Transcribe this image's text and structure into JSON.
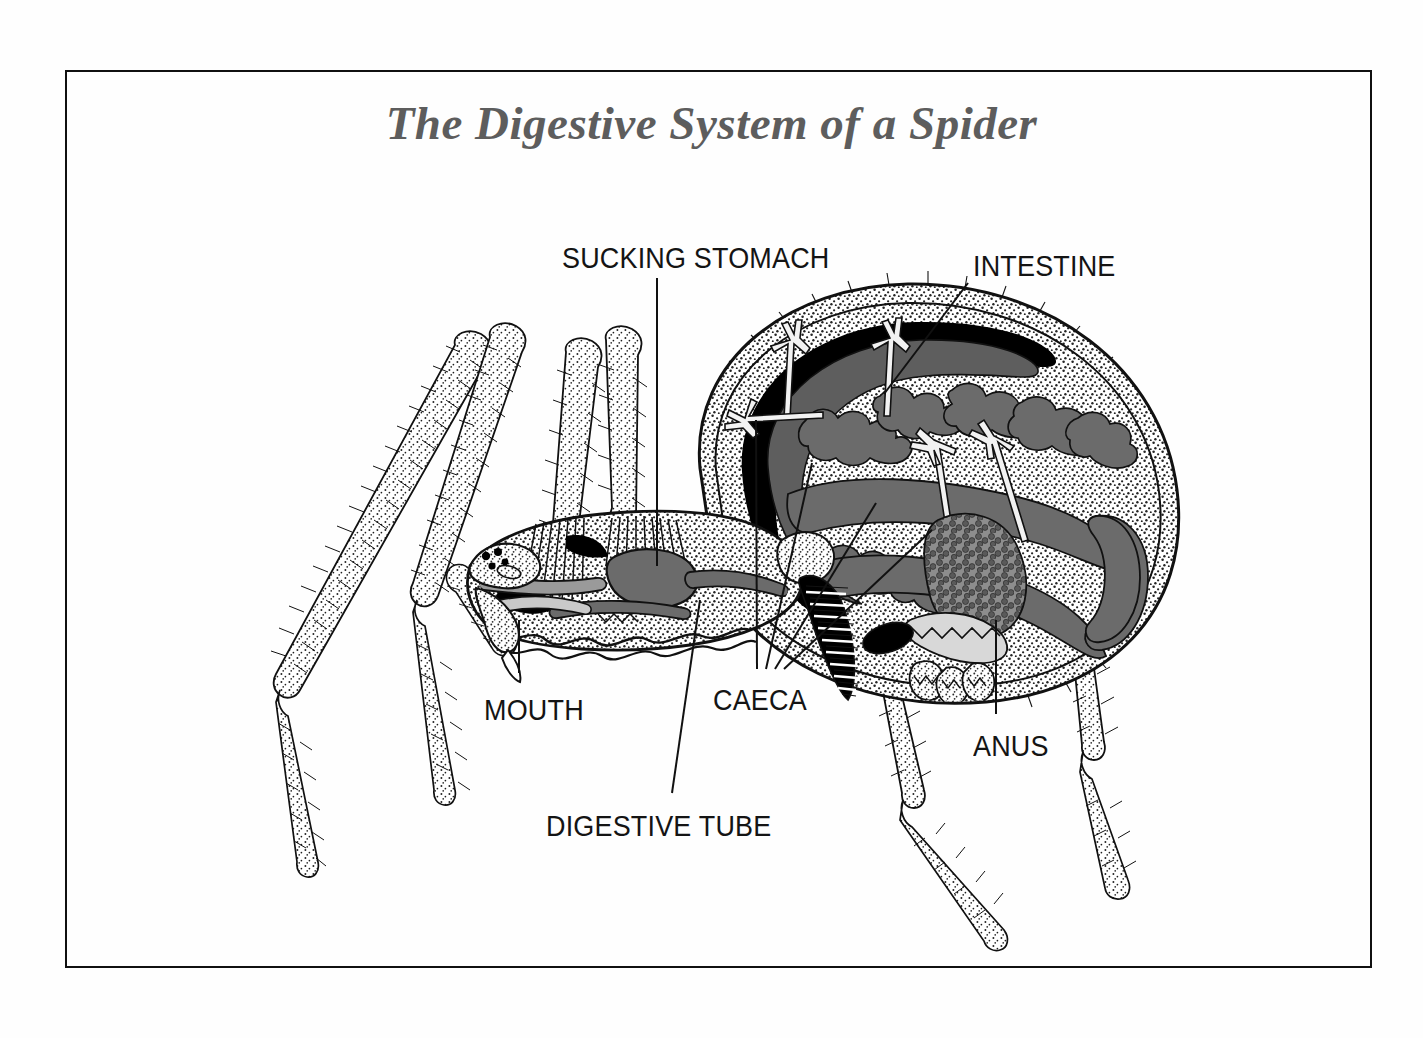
{
  "figure": {
    "title": "The Digestive System of a Spider",
    "title_color": "#5d5d5d",
    "frame_color": "#101010",
    "background_color": "#fefefe",
    "style": "stippled-line-drawing"
  },
  "labels": [
    {
      "id": "sucking-stomach",
      "text": "SUCKING STOMACH",
      "x": 562,
      "y": 242
    },
    {
      "id": "intestine",
      "text": "INTESTINE",
      "x": 973,
      "y": 250
    },
    {
      "id": "mouth",
      "text": "MOUTH",
      "x": 484,
      "y": 694
    },
    {
      "id": "caeca",
      "text": "CAECA",
      "x": 713,
      "y": 684
    },
    {
      "id": "anus",
      "text": "ANUS",
      "x": 973,
      "y": 730
    },
    {
      "id": "digestive-tube",
      "text": "DIGESTIVE TUBE",
      "x": 546,
      "y": 810
    }
  ],
  "leader_lines": [
    {
      "id": "sucking-stomach-leader",
      "points": "657,278 657,566"
    },
    {
      "id": "intestine-leader",
      "points": "968,283 884,394"
    },
    {
      "id": "mouth-leader",
      "points": "519,673 519,620"
    },
    {
      "id": "caeca-leader-1",
      "points": "757,669 756,420"
    },
    {
      "id": "caeca-leader-2",
      "points": "766,669 812,463"
    },
    {
      "id": "caeca-leader-3",
      "points": "775,669 876,503"
    },
    {
      "id": "caeca-leader-4",
      "points": "784,669 932,530"
    },
    {
      "id": "anus-leader",
      "points": "996,714 996,620"
    },
    {
      "id": "digestive-tube-leader",
      "points": "672,793 700,600"
    }
  ],
  "colors": {
    "ink": "#111111",
    "organ_gray": "#6b6b6b",
    "organ_dark": "#4a4a4a",
    "organ_light": "#c9c9c9",
    "stipple": "#2a2a2a",
    "black": "#000000",
    "paper": "#fefefe"
  },
  "anatomy_parts": [
    "cephalothorax",
    "abdomen",
    "chelicera",
    "pedipalp",
    "eyes",
    "sucking stomach",
    "digestive tube",
    "caeca",
    "intestine",
    "heart",
    "rectal sac",
    "anus",
    "mouth",
    "walking legs"
  ]
}
